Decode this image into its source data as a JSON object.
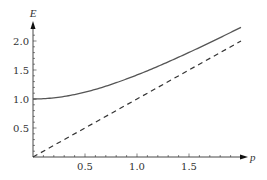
{
  "chart_data": {
    "type": "line",
    "title": "",
    "xlabel": "p",
    "ylabel": "E",
    "xlim": [
      0,
      2.0
    ],
    "ylim": [
      0,
      2.25
    ],
    "grid": false,
    "legend": null,
    "x_ticks": [
      "0.5",
      "1.0",
      "1.5"
    ],
    "y_ticks": [
      "0.5",
      "1.0",
      "1.5",
      "2.0"
    ],
    "series": [
      {
        "name": "E = sqrt(1 + p^2)",
        "style": "solid",
        "x": [
          0,
          0.25,
          0.5,
          0.75,
          1.0,
          1.25,
          1.5,
          1.75,
          2.0
        ],
        "values": [
          1.0,
          1.031,
          1.118,
          1.25,
          1.414,
          1.601,
          1.803,
          2.016,
          2.236
        ]
      },
      {
        "name": "E = p",
        "style": "dashed",
        "x": [
          0,
          0.5,
          1.0,
          1.5,
          2.0
        ],
        "values": [
          0,
          0.5,
          1.0,
          1.5,
          2.0
        ]
      }
    ]
  },
  "axes": {
    "x_label": "p",
    "y_label": "E",
    "x_ticks": [
      {
        "value": 0.5,
        "label": "0.5"
      },
      {
        "value": 1.0,
        "label": "1.0"
      },
      {
        "value": 1.5,
        "label": "1.5"
      }
    ],
    "y_ticks": [
      {
        "value": 0.5,
        "label": "0.5"
      },
      {
        "value": 1.0,
        "label": "1.0"
      },
      {
        "value": 1.5,
        "label": "1.5"
      },
      {
        "value": 2.0,
        "label": "2.0"
      }
    ]
  },
  "colors": {
    "axis": "#333333",
    "solid_line": "#555555",
    "dashed_line": "#333333"
  }
}
